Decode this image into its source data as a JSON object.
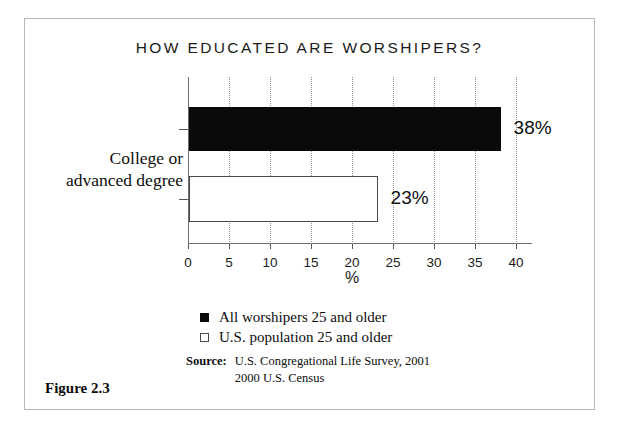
{
  "figure": {
    "caption": "Figure 2.3"
  },
  "chart_data": {
    "type": "bar",
    "orientation": "horizontal",
    "title": "HOW EDUCATED ARE WORSHIPERS?",
    "xlabel": "%",
    "ylabel": "",
    "categories": [
      "College or advanced degree"
    ],
    "category_label_lines": [
      "College or",
      "advanced degree"
    ],
    "series": [
      {
        "name": "All worshipers 25 and older",
        "values": [
          38
        ],
        "value_labels": [
          "38%"
        ],
        "color": "#0a0a0a",
        "swatch": "filled"
      },
      {
        "name": "U.S. population 25 and older",
        "values": [
          23
        ],
        "value_labels": [
          "23%"
        ],
        "color": "#ffffff",
        "swatch": "hollow"
      }
    ],
    "xlim": [
      0,
      40
    ],
    "xticks": [
      0,
      5,
      10,
      15,
      20,
      25,
      30,
      35,
      40
    ],
    "xtick_labels": [
      "0",
      "5",
      "10",
      "15",
      "20",
      "25",
      "30",
      "35",
      "40"
    ],
    "grid": true,
    "grid_style": "dotted-vertical",
    "legend_position": "below-axis-left"
  },
  "legend": {
    "entries": [
      {
        "label": "All worshipers 25 and older",
        "swatch": "filled"
      },
      {
        "label": "U.S. population 25 and older",
        "swatch": "hollow"
      }
    ]
  },
  "source": {
    "label": "Source:",
    "lines": [
      "U.S. Congregational Life Survey, 2001",
      "2000 U.S. Census"
    ]
  }
}
